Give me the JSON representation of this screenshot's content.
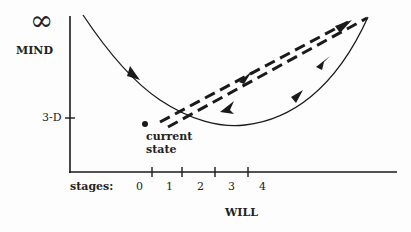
{
  "diagram": {
    "y_axis": {
      "label": "MIND",
      "top_symbol": "∞",
      "tick_label": "3-D"
    },
    "x_axis": {
      "label": "WILL",
      "stages_label": "stages:",
      "stages": [
        "0",
        "1",
        "2",
        "3",
        "4"
      ]
    },
    "point": {
      "label_line1": "current",
      "label_line2": "state"
    },
    "paths": [
      {
        "name": "solid-curve",
        "style": "solid",
        "description": "descends from top-left, dips below 3-D, rises to upper right"
      },
      {
        "name": "dashed-outbound",
        "style": "dashed",
        "direction": "up-right"
      },
      {
        "name": "dashed-return",
        "style": "dashed",
        "direction": "down-left"
      }
    ],
    "colors": {
      "ink": "#1a1a1a",
      "background": "#fdfdfd"
    }
  }
}
